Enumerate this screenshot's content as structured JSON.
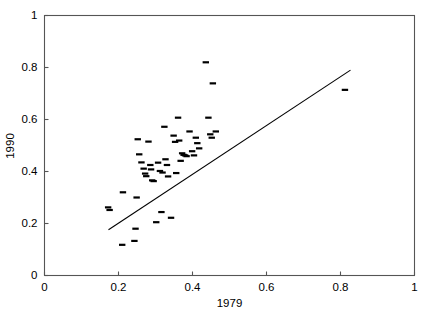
{
  "chart_data": {
    "type": "scatter",
    "title": "",
    "xlabel": "1979",
    "ylabel": "1990",
    "xlim": [
      0,
      1
    ],
    "ylim": [
      0,
      1
    ],
    "xticks": [
      0,
      0.2,
      0.4,
      0.6,
      0.8,
      1
    ],
    "yticks": [
      0,
      0.2,
      0.4,
      0.6,
      0.8,
      1
    ],
    "xtick_labels": [
      "0",
      "0.2",
      "0.4",
      "0.6",
      "0.8",
      "1"
    ],
    "ytick_labels": [
      "0",
      "0.2",
      "0.4",
      "0.6",
      "0.8",
      "1"
    ],
    "grid": false,
    "legend": null,
    "marker": "horizontal-dash",
    "marker_color": "#000000",
    "points": [
      {
        "x": 0.172,
        "y": 0.262
      },
      {
        "x": 0.176,
        "y": 0.252
      },
      {
        "x": 0.21,
        "y": 0.118
      },
      {
        "x": 0.212,
        "y": 0.32
      },
      {
        "x": 0.243,
        "y": 0.133
      },
      {
        "x": 0.246,
        "y": 0.18
      },
      {
        "x": 0.249,
        "y": 0.3
      },
      {
        "x": 0.252,
        "y": 0.524
      },
      {
        "x": 0.256,
        "y": 0.466
      },
      {
        "x": 0.262,
        "y": 0.435
      },
      {
        "x": 0.268,
        "y": 0.411
      },
      {
        "x": 0.272,
        "y": 0.392
      },
      {
        "x": 0.275,
        "y": 0.382
      },
      {
        "x": 0.281,
        "y": 0.515
      },
      {
        "x": 0.286,
        "y": 0.425
      },
      {
        "x": 0.288,
        "y": 0.408
      },
      {
        "x": 0.291,
        "y": 0.366
      },
      {
        "x": 0.295,
        "y": 0.363
      },
      {
        "x": 0.302,
        "y": 0.205
      },
      {
        "x": 0.307,
        "y": 0.434
      },
      {
        "x": 0.312,
        "y": 0.402
      },
      {
        "x": 0.316,
        "y": 0.244
      },
      {
        "x": 0.319,
        "y": 0.396
      },
      {
        "x": 0.324,
        "y": 0.572
      },
      {
        "x": 0.327,
        "y": 0.447
      },
      {
        "x": 0.331,
        "y": 0.425
      },
      {
        "x": 0.334,
        "y": 0.381
      },
      {
        "x": 0.342,
        "y": 0.222
      },
      {
        "x": 0.349,
        "y": 0.538
      },
      {
        "x": 0.353,
        "y": 0.514
      },
      {
        "x": 0.356,
        "y": 0.394
      },
      {
        "x": 0.361,
        "y": 0.607
      },
      {
        "x": 0.364,
        "y": 0.519
      },
      {
        "x": 0.368,
        "y": 0.441
      },
      {
        "x": 0.372,
        "y": 0.47
      },
      {
        "x": 0.376,
        "y": 0.464
      },
      {
        "x": 0.38,
        "y": 0.462
      },
      {
        "x": 0.384,
        "y": 0.459
      },
      {
        "x": 0.392,
        "y": 0.554
      },
      {
        "x": 0.399,
        "y": 0.478
      },
      {
        "x": 0.404,
        "y": 0.462
      },
      {
        "x": 0.409,
        "y": 0.53
      },
      {
        "x": 0.413,
        "y": 0.509
      },
      {
        "x": 0.418,
        "y": 0.489
      },
      {
        "x": 0.436,
        "y": 0.82
      },
      {
        "x": 0.443,
        "y": 0.607
      },
      {
        "x": 0.448,
        "y": 0.543
      },
      {
        "x": 0.452,
        "y": 0.53
      },
      {
        "x": 0.455,
        "y": 0.739
      },
      {
        "x": 0.463,
        "y": 0.554
      },
      {
        "x": 0.812,
        "y": 0.714
      }
    ],
    "fit_line": {
      "label": "regression line",
      "x_start": 0.173,
      "y_start": 0.176,
      "x_end": 0.827,
      "y_end": 0.79,
      "color": "#000000"
    }
  },
  "axes": {
    "x_title": "1979",
    "y_title": "1990"
  }
}
